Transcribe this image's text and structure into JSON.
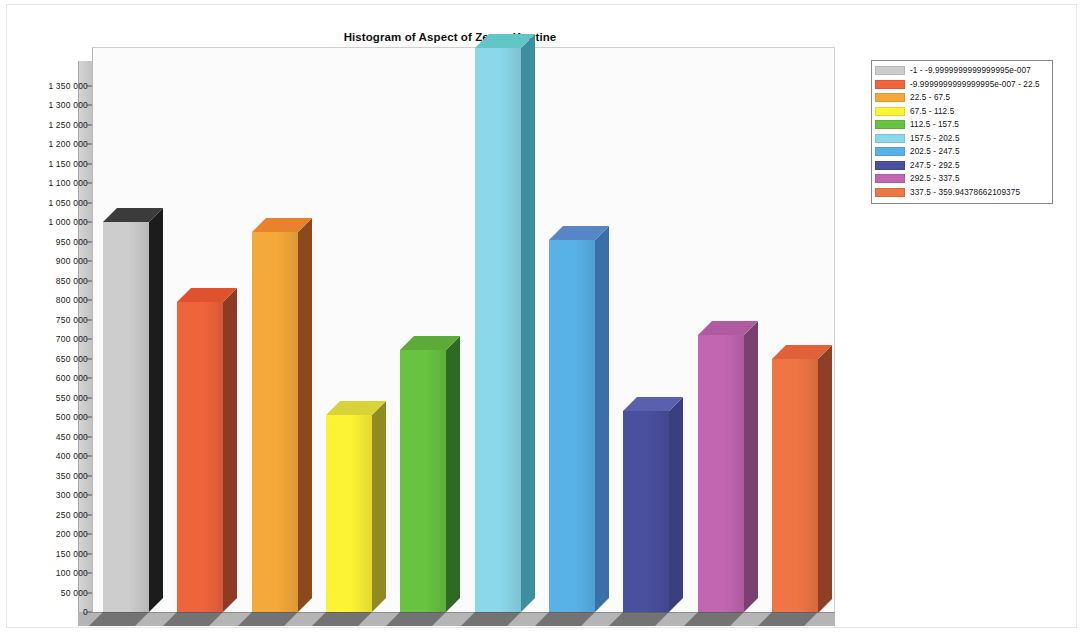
{
  "chart_data": {
    "type": "bar",
    "title": "Histogram of Aspect of Zeuss-Koutine",
    "xlabel": "",
    "ylabel": "",
    "ylim": [
      0,
      1380000
    ],
    "ytick_step": 50000,
    "grid": false,
    "legend_position": "right",
    "style": "3d-column",
    "categories": [
      "-1 - -9.9999999999999995e-007",
      "-9.9999999999999995e-007 - 22.5",
      "22.5 - 67.5",
      "67.5 - 112.5",
      "112.5 - 157.5",
      "157.5 - 202.5",
      "202.5 - 247.5",
      "247.5 - 292.5",
      "292.5 - 337.5",
      "337.5 - 359.94378662109375"
    ],
    "values": [
      1000000,
      795000,
      975000,
      505000,
      672000,
      1445000,
      955000,
      515000,
      710000,
      650000
    ],
    "value_notes": [
      "",
      "",
      "",
      "",
      "",
      "clipped at top of plot area",
      "",
      "",
      "",
      ""
    ],
    "colors": [
      "#cdcdcd",
      "#f0643c",
      "#f5a93a",
      "#fbf334",
      "#68c340",
      "#8bd8ea",
      "#58b2e8",
      "#4a4f9e",
      "#c266b2",
      "#f07545"
    ],
    "top_colors": [
      "#3b3b3b",
      "#e0512e",
      "#e8832c",
      "#d9d33a",
      "#5cab38",
      "#62c6c6",
      "#5686c6",
      "#5a60ad",
      "#b05aa0",
      "#e0623a"
    ],
    "side_colors": [
      "#1c1c1c",
      "#8d3b24",
      "#8a4a1e",
      "#8f8a22",
      "#2f6a24",
      "#3d8fa0",
      "#3a6fa8",
      "#3a3f7e",
      "#7c3f72",
      "#8d4026"
    ],
    "ytick_labels": [
      "0",
      "50 000",
      "100 000",
      "150 000",
      "200 000",
      "250 000",
      "300 000",
      "350 000",
      "400 000",
      "450 000",
      "500 000",
      "550 000",
      "600 000",
      "650 000",
      "700 000",
      "750 000",
      "800 000",
      "850 000",
      "900 000",
      "950 000",
      "1 000 000",
      "1 050 000",
      "1 100 000",
      "1 150 000",
      "1 200 000",
      "1 250 000",
      "1 300 000",
      "1 350 000"
    ],
    "ytick_values": [
      0,
      50000,
      100000,
      150000,
      200000,
      250000,
      300000,
      350000,
      400000,
      450000,
      500000,
      550000,
      600000,
      650000,
      700000,
      750000,
      800000,
      850000,
      900000,
      950000,
      1000000,
      1050000,
      1100000,
      1150000,
      1200000,
      1250000,
      1300000,
      1350000
    ]
  },
  "legend": {
    "entries": [
      {
        "label": "-1 - -9.9999999999999995e-007",
        "color": "#cdcdcd"
      },
      {
        "label": "-9.9999999999999995e-007 - 22.5",
        "color": "#f0643c"
      },
      {
        "label": "22.5 - 67.5",
        "color": "#f5a93a"
      },
      {
        "label": "67.5 - 112.5",
        "color": "#fbf334"
      },
      {
        "label": "112.5 - 157.5",
        "color": "#68c340"
      },
      {
        "label": "157.5 - 202.5",
        "color": "#8bd8ea"
      },
      {
        "label": "202.5 - 247.5",
        "color": "#58b2e8"
      },
      {
        "label": "247.5 - 292.5",
        "color": "#4a4f9e"
      },
      {
        "label": "292.5 - 337.5",
        "color": "#c266b2"
      },
      {
        "label": "337.5 - 359.94378662109375",
        "color": "#f07545"
      }
    ]
  }
}
